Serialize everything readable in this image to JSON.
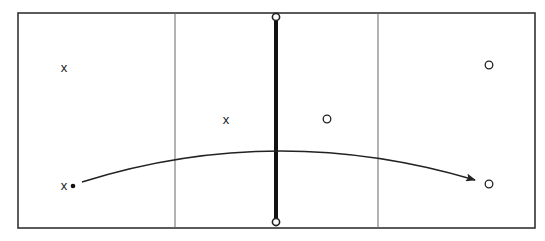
{
  "diagram": {
    "colors": {
      "line": "#222222",
      "thin_divider": "#555555",
      "background": "#ffffff"
    },
    "frame": {
      "x": 18,
      "y": 13,
      "width": 517,
      "height": 215
    },
    "dividers": [
      {
        "x": 175
      },
      {
        "x": 378
      }
    ],
    "boundary": {
      "x": 276,
      "y1": 17,
      "y2": 222,
      "endpoint_style": "open-circle"
    },
    "markers": [
      {
        "label": "x",
        "class": "X",
        "x": 64,
        "y": 69
      },
      {
        "label": "x",
        "class": "X",
        "x": 226,
        "y": 121
      },
      {
        "label": "x",
        "class": "X",
        "x": 64,
        "y": 187
      },
      {
        "label": "o",
        "class": "O",
        "x": 489,
        "y": 65
      },
      {
        "label": "o",
        "class": "O",
        "x": 327,
        "y": 119
      },
      {
        "label": "o",
        "class": "O",
        "x": 489,
        "y": 184
      }
    ],
    "start_point": {
      "x": 73,
      "y": 186
    },
    "arrow": {
      "from": [
        82,
        182
      ],
      "control": [
        276,
        121
      ],
      "to": [
        475,
        180
      ]
    }
  }
}
